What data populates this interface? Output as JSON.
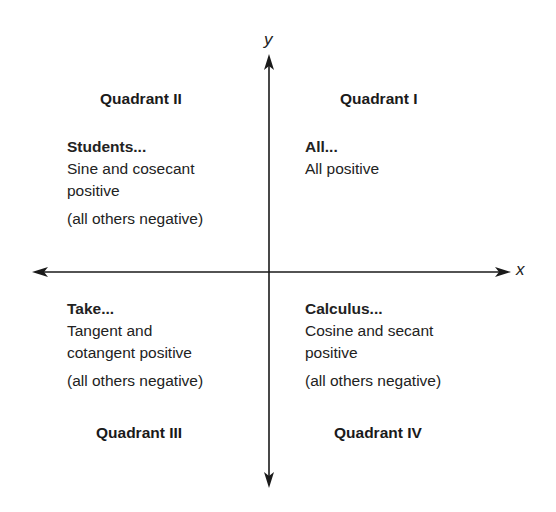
{
  "diagram": {
    "axes": {
      "x_label": "x",
      "y_label": "y"
    },
    "quadrants": [
      {
        "id": "I",
        "title": "Quadrant I",
        "mnemonic": "All...",
        "lines": [
          "All positive"
        ],
        "note": ""
      },
      {
        "id": "II",
        "title": "Quadrant II",
        "mnemonic": "Students...",
        "lines": [
          "Sine and cosecant",
          "positive"
        ],
        "note": "(all others negative)"
      },
      {
        "id": "III",
        "title": "Quadrant III",
        "mnemonic": "Take...",
        "lines": [
          "Tangent and",
          "cotangent positive"
        ],
        "note": "(all others negative)"
      },
      {
        "id": "IV",
        "title": "Quadrant IV",
        "mnemonic": "Calculus...",
        "lines": [
          "Cosine and secant",
          "positive"
        ],
        "note": "(all others negative)"
      }
    ],
    "colors": {
      "ink": "#1a1a1a",
      "background": "#ffffff"
    }
  }
}
